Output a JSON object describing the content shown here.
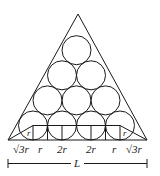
{
  "diagram": {
    "circle_rows": [
      1,
      2,
      3,
      4
    ],
    "base_segments": [
      {
        "label": "√3r"
      },
      {
        "label": "r"
      },
      {
        "label": "2r"
      },
      {
        "label": "2r"
      },
      {
        "label": "r"
      },
      {
        "label": "√3r"
      }
    ],
    "corner_triangle_labels": {
      "left": "r",
      "right": "r"
    },
    "dimension": {
      "label": "L"
    }
  }
}
